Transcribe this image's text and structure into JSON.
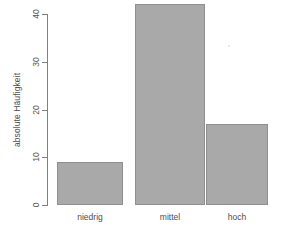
{
  "chart_data": {
    "type": "bar",
    "title": "",
    "subtitle": "",
    "xlabel": "",
    "ylabel": "absolute Häufigkeit",
    "categories": [
      "niedrig",
      "mittel",
      "hoch"
    ],
    "values": [
      9,
      42,
      17
    ],
    "series": [
      {
        "name": "absolute Häufigkeit",
        "values": [
          9,
          42,
          17
        ]
      }
    ],
    "ylim": [
      0,
      44
    ],
    "yticks": [
      0,
      10,
      20,
      30,
      40
    ],
    "ytick_labels": [
      "0",
      "10",
      "20",
      "30",
      "40"
    ],
    "grid": false,
    "legend": false,
    "legend_position": "none",
    "bar_color": "#a9a9a9",
    "bar_border_color": "#8f8f8f",
    "axis_color": "#808080",
    "text_color": "#4d4d4d",
    "background_color": "#ffffff",
    "ylabel_rotation": "90",
    "ytick_rotation": "90"
  },
  "figure": {
    "plot_left_px": "47",
    "plot_baseline_px": "205",
    "px_per_unit": "4.775"
  }
}
